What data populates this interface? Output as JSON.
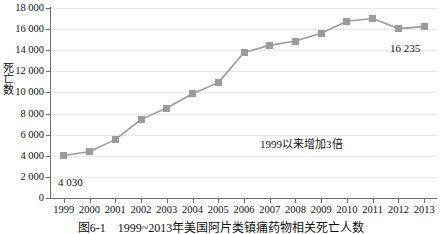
{
  "chart_data": {
    "type": "line",
    "title": "",
    "xlabel": "",
    "ylabel": "死亡数",
    "categories": [
      "1999",
      "2000",
      "2001",
      "2002",
      "2003",
      "2004",
      "2005",
      "2006",
      "2007",
      "2008",
      "2009",
      "2010",
      "2011",
      "2012",
      "2013"
    ],
    "values": [
      4030,
      4400,
      5530,
      7450,
      8520,
      9870,
      10930,
      13790,
      14460,
      14870,
      15600,
      16750,
      17000,
      16050,
      16235
    ],
    "ylim": [
      0,
      18000
    ],
    "yticks": [
      0,
      2000,
      4000,
      6000,
      8000,
      10000,
      12000,
      14000,
      16000,
      18000
    ],
    "ytick_labels": [
      "0",
      "2 000",
      "4 000",
      "6 000",
      "8 000",
      "10 000",
      "12 000",
      "14 000",
      "16 000",
      "18 000"
    ],
    "grid": true,
    "legend": "none",
    "series_color": "#9b9b9b",
    "marker": "square",
    "data_labels": [
      {
        "category": "1999",
        "text": "4 030"
      },
      {
        "category": "2013",
        "text": "16 235"
      }
    ],
    "annotations": [
      {
        "text": "1999以来增加3倍"
      }
    ]
  },
  "caption": {
    "text": "图6-1　1999~2013年美国阿片类镇痛药物相关死亡人数"
  }
}
